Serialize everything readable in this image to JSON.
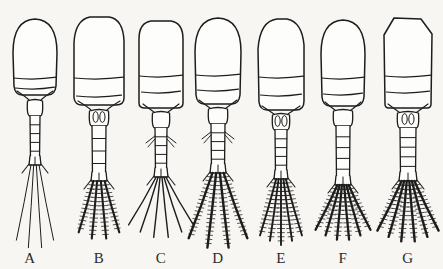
{
  "figure": {
    "background_color": "#f7f6f3",
    "ink_color": "#1d1d1d",
    "width": 443,
    "height": 269
  },
  "specimens": [
    {
      "id": "A",
      "label": "A",
      "label_x": 30,
      "label_y": 250,
      "axis_x": 35,
      "prosome_shape": "rounded-oval",
      "prosome_top": 19,
      "prosome_half_width": 22,
      "prosome_bottom": 95,
      "segment_lines": [
        78,
        88
      ],
      "urosome_top": 98,
      "urosome_bottom": 160,
      "urosome_half_width": 5,
      "urosome_rings": 5,
      "genital_ovals": false,
      "lateral_spines": false,
      "seta_count": 4,
      "seta_length": 86,
      "seta_spread": 11,
      "seta_plumose": false,
      "seta_weight": 1.0
    },
    {
      "id": "B",
      "label": "B",
      "label_x": 99,
      "label_y": 250,
      "axis_x": 99,
      "prosome_shape": "broad-shouldered",
      "prosome_top": 17,
      "prosome_half_width": 25,
      "prosome_bottom": 105,
      "segment_lines": [
        78,
        96
      ],
      "urosome_top": 108,
      "urosome_bottom": 176,
      "urosome_half_width": 7,
      "urosome_rings": 4,
      "genital_ovals": true,
      "lateral_spines": false,
      "seta_count": 4,
      "seta_length": 60,
      "seta_spread": 16,
      "seta_plumose": true,
      "seta_weight": 2.1
    },
    {
      "id": "C",
      "label": "C",
      "label_x": 161,
      "label_y": 250,
      "axis_x": 161,
      "prosome_shape": "square-capped",
      "prosome_top": 21,
      "prosome_half_width": 22,
      "prosome_bottom": 108,
      "segment_lines": [
        76,
        92
      ],
      "urosome_top": 110,
      "urosome_bottom": 172,
      "urosome_half_width": 6,
      "urosome_rings": 5,
      "genital_ovals": false,
      "lateral_spines": true,
      "seta_count": 6,
      "seta_length": 62,
      "seta_spread": 30,
      "seta_plumose": false,
      "seta_weight": 1.4
    },
    {
      "id": "D",
      "label": "D",
      "label_x": 218,
      "label_y": 250,
      "axis_x": 218,
      "prosome_shape": "rounded-oval",
      "prosome_top": 18,
      "prosome_half_width": 23,
      "prosome_bottom": 104,
      "segment_lines": [
        75,
        90
      ],
      "urosome_top": 106,
      "urosome_bottom": 168,
      "urosome_half_width": 7,
      "urosome_rings": 5,
      "genital_ovals": false,
      "lateral_spines": true,
      "seta_count": 4,
      "seta_length": 78,
      "seta_spread": 20,
      "seta_plumose": true,
      "seta_weight": 2.4
    },
    {
      "id": "E",
      "label": "E",
      "label_x": 281,
      "label_y": 250,
      "axis_x": 281,
      "prosome_shape": "asymmetric-oval",
      "prosome_top": 19,
      "prosome_half_width": 23,
      "prosome_bottom": 110,
      "segment_lines": [
        77,
        95
      ],
      "urosome_top": 112,
      "urosome_bottom": 174,
      "urosome_half_width": 6,
      "urosome_rings": 5,
      "genital_ovals": true,
      "lateral_spines": false,
      "seta_count": 5,
      "seta_length": 66,
      "seta_spread": 16,
      "seta_plumose": true,
      "seta_weight": 1.9
    },
    {
      "id": "F",
      "label": "F",
      "label_x": 343,
      "label_y": 250,
      "axis_x": 343,
      "prosome_shape": "rounded-oval",
      "prosome_top": 20,
      "prosome_half_width": 22,
      "prosome_bottom": 106,
      "segment_lines": [
        78,
        94
      ],
      "urosome_top": 108,
      "urosome_bottom": 180,
      "urosome_half_width": 7,
      "urosome_rings": 5,
      "genital_ovals": false,
      "lateral_spines": false,
      "seta_count": 6,
      "seta_length": 56,
      "seta_spread": 26,
      "seta_plumose": true,
      "seta_weight": 2.3
    },
    {
      "id": "G",
      "label": "G",
      "label_x": 408,
      "label_y": 250,
      "axis_x": 408,
      "prosome_shape": "angular-peaked",
      "prosome_top": 18,
      "prosome_half_width": 24,
      "prosome_bottom": 108,
      "segment_lines": [
        76,
        92
      ],
      "urosome_top": 110,
      "urosome_bottom": 176,
      "urosome_half_width": 8,
      "urosome_rings": 5,
      "genital_ovals": true,
      "lateral_spines": false,
      "seta_count": 6,
      "seta_length": 62,
      "seta_spread": 26,
      "seta_plumose": true,
      "seta_weight": 2.4
    }
  ]
}
